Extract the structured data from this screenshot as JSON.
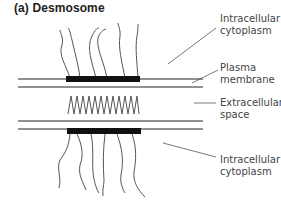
{
  "title": "(a) Desmosome",
  "labels": {
    "intracellular_top": [
      "Intracellular",
      "cytoplasm"
    ],
    "plasma_membrane": [
      "Plasma",
      "membrane"
    ],
    "extracellular": [
      "Extracellular",
      "space"
    ],
    "intracellular_bottom": [
      "Intracellular",
      "cytoplasm"
    ]
  },
  "colors": {
    "line": "#222222",
    "plaque": "#111111",
    "filament": "#555555",
    "leader": "#555555",
    "text": "#444444"
  }
}
